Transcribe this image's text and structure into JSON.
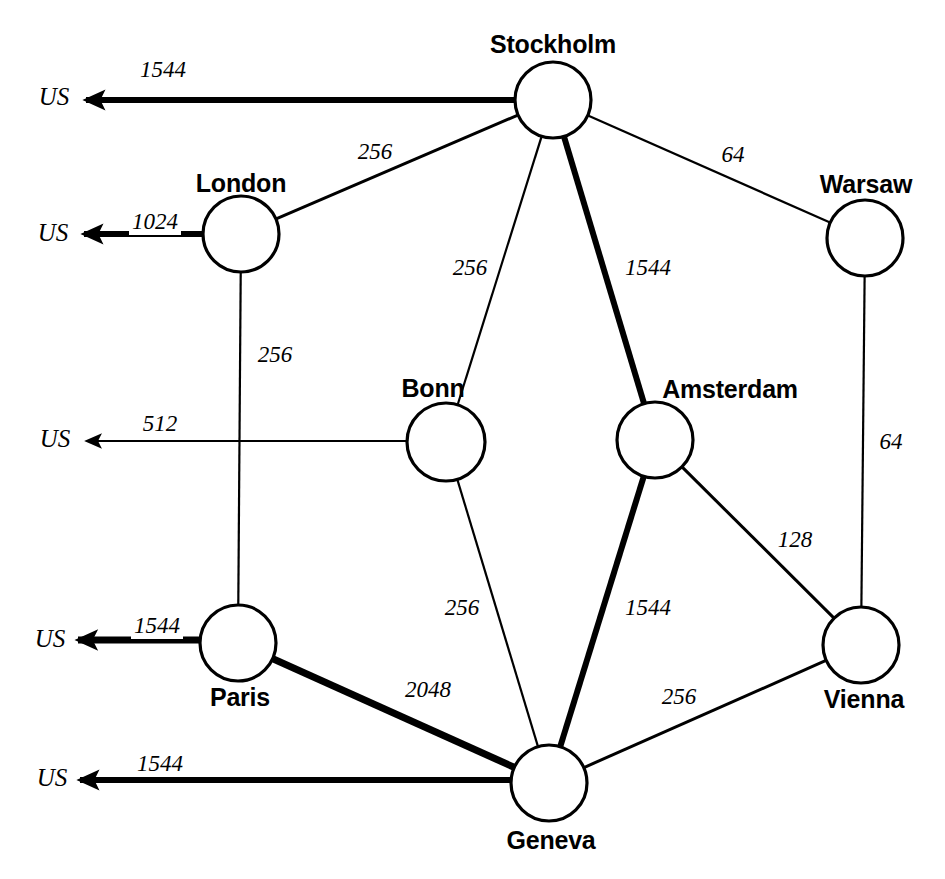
{
  "diagram": {
    "type": "network-graph",
    "stroke_color": "#000000",
    "background_color": "#ffffff",
    "us_gateway_label": "US"
  },
  "nodes": [
    {
      "id": "stockholm",
      "label": "Stockholm",
      "cx": 553,
      "cy": 100,
      "r": 38,
      "label_x": 553,
      "label_y": 44
    },
    {
      "id": "london",
      "label": "London",
      "cx": 241,
      "cy": 234,
      "r": 38,
      "label_x": 241,
      "label_y": 183
    },
    {
      "id": "warsaw",
      "label": "Warsaw",
      "cx": 865,
      "cy": 238,
      "r": 38,
      "label_x": 866,
      "label_y": 184
    },
    {
      "id": "bonn",
      "label": "Bonn",
      "cx": 446,
      "cy": 442,
      "r": 39,
      "label_x": 433,
      "label_y": 388
    },
    {
      "id": "amsterdam",
      "label": "Amsterdam",
      "cx": 655,
      "cy": 440,
      "r": 38,
      "label_x": 730,
      "label_y": 389
    },
    {
      "id": "vienna",
      "label": "Vienna",
      "cx": 861,
      "cy": 645,
      "r": 38,
      "label_x": 864,
      "label_y": 699
    },
    {
      "id": "paris",
      "label": "Paris",
      "cx": 238,
      "cy": 643,
      "r": 38,
      "label_x": 240,
      "label_y": 697
    },
    {
      "id": "geneva",
      "label": "Geneva",
      "cx": 549,
      "cy": 783,
      "r": 38,
      "label_x": 551,
      "label_y": 840
    }
  ],
  "links": [
    {
      "id": "stockholm-london",
      "from": "stockholm",
      "to": "london",
      "bandwidth": "256",
      "weight": "w-med",
      "label_x": 375,
      "label_y": 152
    },
    {
      "id": "stockholm-warsaw",
      "from": "stockholm",
      "to": "warsaw",
      "bandwidth": "64",
      "weight": "w-thin",
      "label_x": 733,
      "label_y": 155
    },
    {
      "id": "stockholm-bonn",
      "from": "stockholm",
      "to": "bonn",
      "bandwidth": "256",
      "weight": "w-thin",
      "label_x": 470,
      "label_y": 268
    },
    {
      "id": "stockholm-amsterdam",
      "from": "stockholm",
      "to": "amsterdam",
      "bandwidth": "1544",
      "weight": "w-thick",
      "label_x": 648,
      "label_y": 268
    },
    {
      "id": "london-paris",
      "from": "london",
      "to": "paris",
      "bandwidth": "256",
      "weight": "w-thin",
      "label_x": 275,
      "label_y": 355
    },
    {
      "id": "warsaw-vienna",
      "from": "warsaw",
      "to": "vienna",
      "bandwidth": "64",
      "weight": "w-thin",
      "label_x": 891,
      "label_y": 442
    },
    {
      "id": "bonn-geneva",
      "from": "bonn",
      "to": "geneva",
      "bandwidth": "256",
      "weight": "w-thin",
      "label_x": 462,
      "label_y": 608
    },
    {
      "id": "amsterdam-geneva",
      "from": "amsterdam",
      "to": "geneva",
      "bandwidth": "1544",
      "weight": "w-thick",
      "label_x": 648,
      "label_y": 608
    },
    {
      "id": "amsterdam-vienna",
      "from": "amsterdam",
      "to": "vienna",
      "bandwidth": "128",
      "weight": "w-med",
      "label_x": 795,
      "label_y": 540
    },
    {
      "id": "paris-geneva",
      "from": "paris",
      "to": "geneva",
      "bandwidth": "2048",
      "weight": "w-xthick",
      "label_x": 428,
      "label_y": 690
    },
    {
      "id": "geneva-vienna",
      "from": "geneva",
      "to": "vienna",
      "bandwidth": "256",
      "weight": "w-med",
      "label_x": 679,
      "label_y": 697
    }
  ],
  "uplinks": [
    {
      "id": "stockholm-us",
      "from": "stockholm",
      "bandwidth": "1544",
      "weight": "w-thick",
      "x1": 515,
      "y1": 100,
      "x2": 86,
      "y2": 100,
      "label_x": 163,
      "label_y": 70,
      "us_x": 54,
      "us_y": 97
    },
    {
      "id": "london-us",
      "from": "london",
      "bandwidth": "1024",
      "weight": "w-thick",
      "x1": 203,
      "y1": 234,
      "x2": 84,
      "y2": 234,
      "label_x": 155,
      "label_y": 222,
      "us_x": 53,
      "us_y": 233
    },
    {
      "id": "bonn-us",
      "from": "bonn",
      "bandwidth": "512",
      "weight": "w-thin",
      "x1": 407,
      "y1": 441,
      "x2": 87,
      "y2": 441,
      "label_x": 160,
      "label_y": 424,
      "us_x": 55,
      "us_y": 439
    },
    {
      "id": "paris-us",
      "from": "paris",
      "bandwidth": "1544",
      "weight": "w-xthick",
      "x1": 200,
      "y1": 640,
      "x2": 78,
      "y2": 640,
      "label_x": 157,
      "label_y": 626,
      "us_x": 50,
      "us_y": 639
    },
    {
      "id": "geneva-us",
      "from": "geneva",
      "bandwidth": "1544",
      "weight": "w-thick",
      "x1": 511,
      "y1": 780,
      "x2": 80,
      "y2": 780,
      "label_x": 160,
      "label_y": 764,
      "us_x": 52,
      "us_y": 778
    }
  ]
}
